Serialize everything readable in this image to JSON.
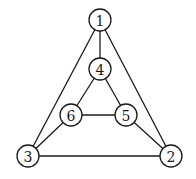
{
  "graph": {
    "node_radius": 11,
    "stroke_color": "#1a1a1a",
    "fill_color": "#ffffff",
    "nodes": [
      {
        "id": "1",
        "label": "1",
        "x": 100,
        "y": 20
      },
      {
        "id": "2",
        "label": "2",
        "x": 171,
        "y": 156
      },
      {
        "id": "3",
        "label": "3",
        "x": 28,
        "y": 156
      },
      {
        "id": "4",
        "label": "4",
        "x": 100,
        "y": 69
      },
      {
        "id": "5",
        "label": "5",
        "x": 126,
        "y": 115
      },
      {
        "id": "6",
        "label": "6",
        "x": 71,
        "y": 115
      }
    ],
    "edges": [
      {
        "from": "1",
        "to": "4"
      },
      {
        "from": "1",
        "to": "3"
      },
      {
        "from": "1",
        "to": "2"
      },
      {
        "from": "4",
        "to": "6"
      },
      {
        "from": "4",
        "to": "5"
      },
      {
        "from": "6",
        "to": "5"
      },
      {
        "from": "6",
        "to": "3"
      },
      {
        "from": "5",
        "to": "2"
      },
      {
        "from": "3",
        "to": "2"
      }
    ]
  }
}
